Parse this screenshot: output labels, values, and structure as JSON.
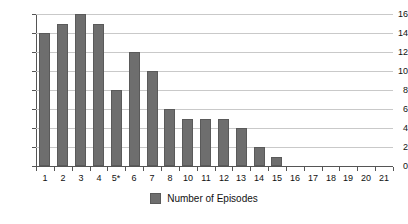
{
  "chart_data": {
    "type": "bar",
    "title": "",
    "xlabel": "",
    "ylabel": "",
    "ylim": [
      0,
      16
    ],
    "ytick_step": 2,
    "yticks": [
      0,
      2,
      4,
      6,
      8,
      10,
      12,
      14,
      16
    ],
    "grid": true,
    "legend_position": "bottom-center",
    "categories": [
      "1",
      "2",
      "3",
      "4",
      "5*",
      "6",
      "7",
      "8",
      "10",
      "11",
      "12",
      "13",
      "14",
      "15",
      "16",
      "17",
      "18",
      "19",
      "20",
      "21"
    ],
    "values": [
      14,
      15,
      16,
      15,
      8,
      12,
      10,
      6,
      5,
      5,
      5,
      4,
      2,
      1,
      0,
      0,
      0,
      0,
      0,
      0
    ],
    "series": [
      {
        "name": "Number of Episodes",
        "color": "#6e6e6e",
        "values": [
          14,
          15,
          16,
          15,
          8,
          12,
          10,
          6,
          5,
          5,
          5,
          4,
          2,
          1,
          0,
          0,
          0,
          0,
          0,
          0
        ]
      }
    ],
    "legend": [
      {
        "label": "Number of Episodes",
        "color": "#6e6e6e"
      }
    ],
    "colors": {
      "bar": "#6e6e6e",
      "bar_border": "#5a5a5a",
      "gridline": "#c9c9c9",
      "axis": "#555555",
      "text": "#111111",
      "background": "#ffffff"
    }
  }
}
